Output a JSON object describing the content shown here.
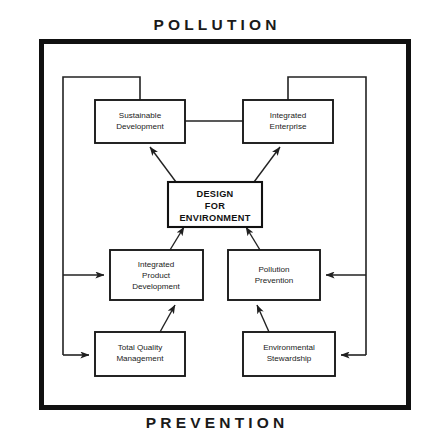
{
  "diagram": {
    "title_top": "POLLUTION",
    "title_bottom": "PREVENTION",
    "frame_color": "#111111",
    "line_color": "#222222",
    "background": "#ffffff",
    "nodes": {
      "sustainable_development": {
        "line1": "Sustainable",
        "line2": "Development"
      },
      "integrated_enterprise": {
        "line1": "Integrated",
        "line2": "Enterprise"
      },
      "design_for_environment": {
        "line1": "DESIGN",
        "line2": "FOR",
        "line3": "ENVIRONMENT"
      },
      "integrated_product_development": {
        "line1": "Integrated",
        "line2": "Product",
        "line3": "Development"
      },
      "pollution_prevention": {
        "line1": "Pollution",
        "line2": "Prevention"
      },
      "total_quality_management": {
        "line1": "Total Quality",
        "line2": "Management"
      },
      "environmental_stewardship": {
        "line1": "Environmental",
        "line2": "Stewardship"
      }
    }
  }
}
